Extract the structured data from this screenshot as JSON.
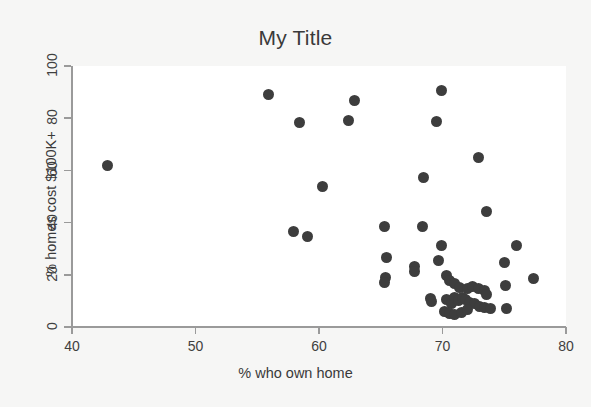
{
  "chart_data": {
    "type": "scatter",
    "title": "My Title",
    "xlabel": "% who own home",
    "ylabel": "% homes cost $100K+",
    "xlim": [
      40,
      80
    ],
    "ylim": [
      0,
      100
    ],
    "xticks": [
      40,
      50,
      60,
      70,
      80
    ],
    "yticks": [
      0,
      20,
      40,
      60,
      80,
      100
    ],
    "grid": false,
    "legend": false,
    "marker": {
      "shape": "circle",
      "color": "#3d3d3d",
      "size_px": 11
    },
    "points": [
      [
        42.9,
        62.0
      ],
      [
        55.9,
        88.9
      ],
      [
        58.4,
        78.5
      ],
      [
        62.4,
        79.3
      ],
      [
        62.9,
        86.8
      ],
      [
        69.9,
        90.6
      ],
      [
        69.5,
        78.6
      ],
      [
        72.9,
        64.8
      ],
      [
        68.5,
        57.4
      ],
      [
        60.3,
        54.0
      ],
      [
        73.6,
        44.2
      ],
      [
        65.3,
        38.6
      ],
      [
        68.4,
        38.6
      ],
      [
        57.9,
        36.6
      ],
      [
        59.1,
        34.7
      ],
      [
        69.9,
        31.4
      ],
      [
        76.0,
        31.2
      ],
      [
        65.5,
        26.8
      ],
      [
        69.7,
        25.4
      ],
      [
        75.0,
        24.9
      ],
      [
        67.7,
        23.0
      ],
      [
        67.7,
        21.4
      ],
      [
        65.4,
        19.0
      ],
      [
        65.3,
        17.0
      ],
      [
        77.4,
        18.4
      ],
      [
        70.3,
        19.7
      ],
      [
        70.6,
        17.8
      ],
      [
        71.0,
        16.5
      ],
      [
        71.4,
        15.0
      ],
      [
        72.0,
        14.6
      ],
      [
        72.4,
        15.4
      ],
      [
        72.9,
        14.6
      ],
      [
        73.4,
        13.8
      ],
      [
        73.6,
        12.3
      ],
      [
        75.1,
        16.0
      ],
      [
        69.0,
        11.0
      ],
      [
        69.1,
        9.6
      ],
      [
        70.3,
        10.6
      ],
      [
        70.7,
        9.0
      ],
      [
        71.0,
        11.2
      ],
      [
        71.3,
        10.0
      ],
      [
        71.6,
        11.4
      ],
      [
        71.9,
        10.6
      ],
      [
        72.2,
        9.4
      ],
      [
        72.6,
        9.0
      ],
      [
        73.0,
        8.0
      ],
      [
        73.4,
        7.6
      ],
      [
        73.9,
        7.0
      ],
      [
        70.2,
        6.0
      ],
      [
        70.6,
        5.2
      ],
      [
        71.0,
        4.6
      ],
      [
        71.5,
        5.6
      ],
      [
        72.0,
        6.6
      ],
      [
        75.2,
        7.0
      ]
    ]
  },
  "colors": {
    "page_background": "#f6f6f5",
    "panel_background": "#ffffff",
    "axis": "#9a9a9a",
    "marker": "#3d3d3d",
    "text": "#3a3a3a"
  }
}
